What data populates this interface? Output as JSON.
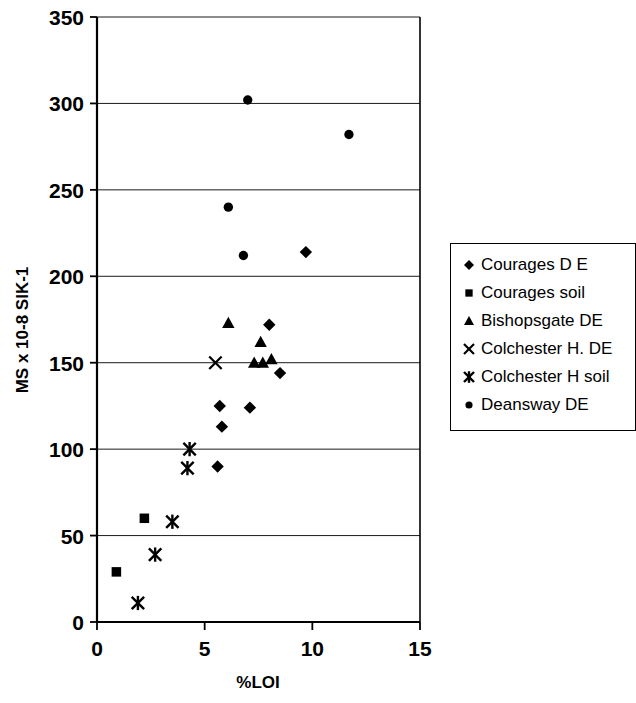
{
  "chart_data": {
    "type": "scatter",
    "title": "",
    "xlabel": "%LOI",
    "ylabel": "MS x 10-8 SIK-1",
    "xlim": [
      0,
      15
    ],
    "ylim": [
      0,
      350
    ],
    "xticks": [
      "0",
      "5",
      "10",
      "15"
    ],
    "yticks": [
      "0",
      "50",
      "100",
      "150",
      "200",
      "250",
      "300",
      "350"
    ],
    "grid": "horizontal",
    "legend_position": "right",
    "series": [
      {
        "name": "Courages D E",
        "marker": "diamond",
        "color": "#000000",
        "points": [
          {
            "x": 9.7,
            "y": 214
          },
          {
            "x": 8.0,
            "y": 172
          },
          {
            "x": 8.5,
            "y": 144
          },
          {
            "x": 5.7,
            "y": 125
          },
          {
            "x": 7.1,
            "y": 124
          },
          {
            "x": 5.8,
            "y": 113
          },
          {
            "x": 5.6,
            "y": 90
          }
        ]
      },
      {
        "name": "Courages soil",
        "marker": "square",
        "color": "#000000",
        "points": [
          {
            "x": 2.2,
            "y": 60
          },
          {
            "x": 0.9,
            "y": 29
          }
        ]
      },
      {
        "name": "Bishopsgate DE",
        "marker": "triangle",
        "color": "#000000",
        "points": [
          {
            "x": 6.1,
            "y": 173
          },
          {
            "x": 7.6,
            "y": 162
          },
          {
            "x": 7.3,
            "y": 150
          },
          {
            "x": 7.7,
            "y": 150
          },
          {
            "x": 8.1,
            "y": 152
          }
        ]
      },
      {
        "name": "Colchester H. DE",
        "marker": "x",
        "color": "#000000",
        "points": [
          {
            "x": 5.5,
            "y": 150
          }
        ]
      },
      {
        "name": "Colchester H soil",
        "marker": "asterisk",
        "color": "#000000",
        "points": [
          {
            "x": 4.3,
            "y": 100
          },
          {
            "x": 4.2,
            "y": 89
          },
          {
            "x": 3.5,
            "y": 58
          },
          {
            "x": 2.7,
            "y": 39
          },
          {
            "x": 1.9,
            "y": 11
          }
        ]
      },
      {
        "name": "Deansway DE",
        "marker": "circle",
        "color": "#000000",
        "points": [
          {
            "x": 7.0,
            "y": 302
          },
          {
            "x": 11.7,
            "y": 282
          },
          {
            "x": 6.1,
            "y": 240
          },
          {
            "x": 6.8,
            "y": 212
          }
        ]
      }
    ]
  },
  "legend": {
    "items": [
      {
        "label": "Courages D E",
        "marker": "diamond"
      },
      {
        "label": "Courages soil",
        "marker": "square"
      },
      {
        "label": "Bishopsgate DE",
        "marker": "triangle"
      },
      {
        "label": "Colchester H. DE",
        "marker": "x"
      },
      {
        "label": "Colchester H soil",
        "marker": "asterisk"
      },
      {
        "label": "Deansway DE",
        "marker": "circle"
      }
    ]
  }
}
